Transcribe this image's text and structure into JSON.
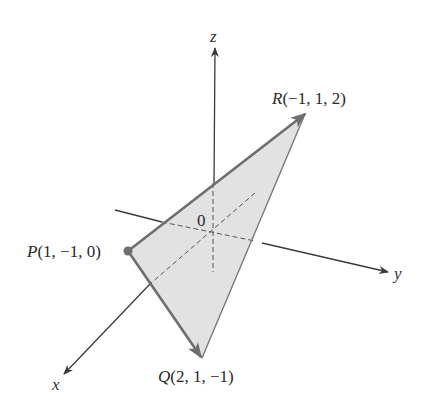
{
  "figure": {
    "type": "3d-vector-diagram",
    "axes": {
      "x": {
        "label": "x"
      },
      "y": {
        "label": "y"
      },
      "z": {
        "label": "z"
      },
      "origin_label": "0"
    },
    "points": {
      "P": {
        "name": "P",
        "coords": "(1, −1, 0)",
        "x": 1,
        "y": -1,
        "z": 0
      },
      "Q": {
        "name": "Q",
        "coords": "(2, 1, −1)",
        "x": 2,
        "y": 1,
        "z": -1
      },
      "R": {
        "name": "R",
        "coords": "(−1, 1, 2)",
        "x": -1,
        "y": 1,
        "z": 2
      }
    },
    "vectors": [
      {
        "from": "P",
        "to": "Q",
        "label": "PQ"
      },
      {
        "from": "P",
        "to": "R",
        "label": "PR"
      }
    ],
    "triangle": [
      "P",
      "Q",
      "R"
    ],
    "colors": {
      "fill": "#e2e2e2",
      "edge": "#7a7a7a",
      "axis": "#3a3a3a",
      "point": "#6e6e6e",
      "text": "#2a2a2a"
    }
  }
}
